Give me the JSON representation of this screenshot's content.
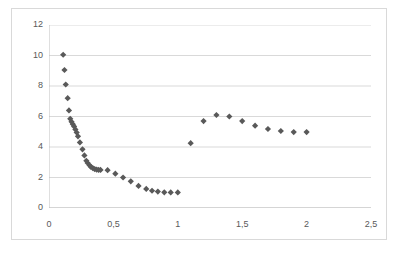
{
  "chart_data": {
    "type": "scatter",
    "title": "",
    "subtitle": "",
    "xlabel": "",
    "ylabel": "",
    "xlim": [
      0,
      2.5
    ],
    "ylim": [
      0,
      12
    ],
    "xticks": [
      0,
      0.5,
      1,
      1.5,
      2,
      2.5
    ],
    "xtick_labels": [
      "0",
      "0,5",
      "1",
      "1,5",
      "2",
      "2,5"
    ],
    "yticks": [
      0,
      2,
      4,
      6,
      8,
      10,
      12
    ],
    "ytick_labels": [
      "0",
      "2",
      "4",
      "6",
      "8",
      "10",
      "12"
    ],
    "grid": "horizontal",
    "legend": "none",
    "decimal_separator": ",",
    "marker": "diamond",
    "marker_color": "#595959",
    "marker_size_px": 5,
    "gridline_color": "#d9d9d9",
    "axis_color": "#bfbfbf",
    "background_color": "#ffffff",
    "border_color": "#d9d9d9",
    "series": [
      {
        "name": "series-1",
        "points": [
          [
            0.11,
            10.05
          ],
          [
            0.12,
            9.05
          ],
          [
            0.13,
            8.1
          ],
          [
            0.145,
            7.2
          ],
          [
            0.155,
            6.4
          ],
          [
            0.165,
            5.85
          ],
          [
            0.175,
            5.65
          ],
          [
            0.185,
            5.5
          ],
          [
            0.195,
            5.35
          ],
          [
            0.205,
            5.15
          ],
          [
            0.215,
            4.95
          ],
          [
            0.225,
            4.7
          ],
          [
            0.24,
            4.3
          ],
          [
            0.26,
            3.85
          ],
          [
            0.275,
            3.45
          ],
          [
            0.29,
            3.1
          ],
          [
            0.3,
            2.95
          ],
          [
            0.315,
            2.8
          ],
          [
            0.325,
            2.7
          ],
          [
            0.34,
            2.62
          ],
          [
            0.355,
            2.55
          ],
          [
            0.37,
            2.52
          ],
          [
            0.385,
            2.5
          ],
          [
            0.4,
            2.5
          ],
          [
            0.455,
            2.48
          ],
          [
            0.515,
            2.25
          ],
          [
            0.575,
            2.0
          ],
          [
            0.635,
            1.75
          ],
          [
            0.695,
            1.45
          ],
          [
            0.755,
            1.25
          ],
          [
            0.8,
            1.13
          ],
          [
            0.845,
            1.08
          ],
          [
            0.895,
            1.03
          ],
          [
            0.945,
            1.02
          ],
          [
            1.0,
            1.02
          ],
          [
            1.1,
            4.25
          ],
          [
            1.2,
            5.7
          ],
          [
            1.3,
            6.1
          ],
          [
            1.4,
            6.0
          ],
          [
            1.5,
            5.7
          ],
          [
            1.6,
            5.4
          ],
          [
            1.7,
            5.18
          ],
          [
            1.8,
            5.05
          ],
          [
            1.9,
            4.98
          ],
          [
            2.0,
            4.98
          ]
        ]
      }
    ]
  }
}
